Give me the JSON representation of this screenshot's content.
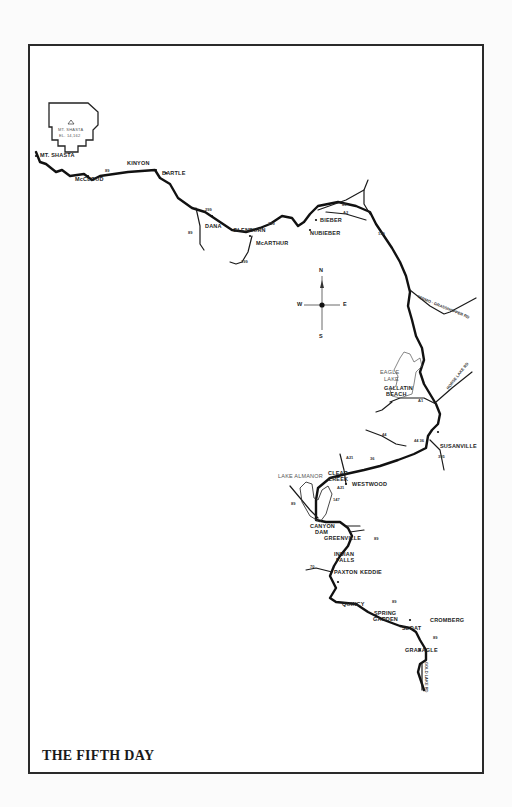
{
  "title": "THE FIFTH DAY",
  "mountain": {
    "name": "MT. SHASTA",
    "elevation": "EL. 14,162"
  },
  "compass": {
    "n": "N",
    "s": "S",
    "e": "E",
    "w": "W"
  },
  "towns": {
    "mt_shasta": "MT. SHASTA",
    "mccloud": "McCLOUD",
    "kinyon": "KINYON",
    "bartle": "BARTLE",
    "dana": "DANA",
    "glenburn": "GLENBURN",
    "mcarthur": "McARTHUR",
    "bieber": "BIEBER",
    "nubieber": "NUBIEBER",
    "gallatin_beach_1": "GALLATIN",
    "gallatin_beach_2": "BEACH",
    "susanville": "SUSANVILLE",
    "clear_creek_1": "CLEAR",
    "clear_creek_2": "CREEK",
    "westwood": "WESTWOOD",
    "canyon_dam_1": "CANYON",
    "canyon_dam_2": "DAM",
    "greenville": "GREENVILLE",
    "indian_falls_1": "INDIAN",
    "indian_falls_2": "FALLS",
    "paxton": "PAXTON",
    "keddie": "KEDDIE",
    "quincy": "QUINCY",
    "spring_garden_1": "SPRING",
    "spring_garden_2": "GARDEN",
    "sloat": "SLOAT",
    "cromberg": "CROMBERG",
    "graeagle": "GRAEAGLE"
  },
  "water": {
    "eagle_lake_1": "EAGLE",
    "eagle_lake_2": "LAKE",
    "lake_almanor": "LAKE ALMANOR"
  },
  "roads": {
    "r89_a": "89",
    "r89_b": "89",
    "r299_a": "299",
    "r299_b": "299",
    "r299_c": "299",
    "r89_c": "89",
    "a2": "A2",
    "r139": "139",
    "termo": "TERMO - GRASSHOPPER RD",
    "horse_lake": "HORSE LAKE RD",
    "a1": "A1",
    "r44": "44",
    "r44_36": "44 36",
    "r36": "36",
    "r395": "395",
    "a21": "A21",
    "a21_b": "A21",
    "r147": "147",
    "r89_d": "89",
    "r89_e": "89",
    "r70": "70",
    "r70_89": "89",
    "r89_f": "89",
    "gold_lake": "GOLD LAKE RD"
  }
}
